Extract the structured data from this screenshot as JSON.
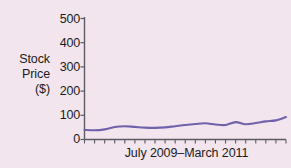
{
  "chart_data": {
    "type": "line",
    "title": "",
    "xlabel": "July 2009–March 2011",
    "ylabel": "Stock Price ($)",
    "ylabel_lines": [
      "Stock",
      "Price",
      "($)"
    ],
    "ylim": [
      0,
      500
    ],
    "ytick_labels": [
      "500",
      "400",
      "300",
      "200",
      "100",
      "0"
    ],
    "ytick_values": [
      500,
      400,
      300,
      200,
      100,
      0
    ],
    "xtick_labels": [],
    "x_tick_count": 21,
    "grid": false,
    "legend": false,
    "series": [
      {
        "name": "Stock Price",
        "color": "#6f62ab",
        "x": [
          0,
          1,
          2,
          3,
          4,
          5,
          6,
          7,
          8,
          9,
          10,
          11,
          12,
          13,
          14,
          15,
          16,
          17,
          18,
          19,
          20
        ],
        "values": [
          40,
          38,
          42,
          52,
          55,
          52,
          49,
          48,
          50,
          55,
          60,
          64,
          67,
          62,
          60,
          72,
          63,
          68,
          75,
          79,
          93
        ]
      }
    ],
    "colors": {
      "line": "#6f62ab",
      "axis": "#5b5b66",
      "background": "#f2e5ee",
      "text": "#1b1b1b"
    }
  }
}
